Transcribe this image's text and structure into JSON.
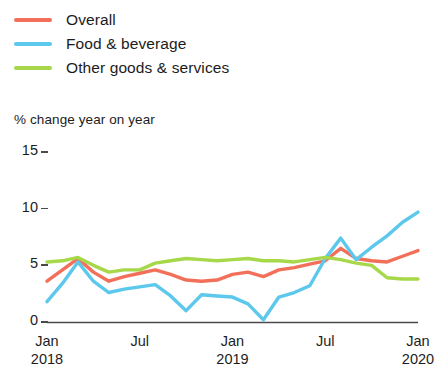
{
  "chart_data": {
    "type": "line",
    "title": "",
    "subtitle": "",
    "xlabel": "",
    "ylabel": "% change year on year",
    "ylim": [
      0,
      15
    ],
    "yticks": [
      0,
      5,
      10,
      15
    ],
    "ytick_labels": [
      "0",
      "5",
      "10",
      "15"
    ],
    "grid": false,
    "legend_position": "top-left",
    "x": [
      "Jan 2018",
      "Feb 2018",
      "Mar 2018",
      "Apr 2018",
      "May 2018",
      "Jun 2018",
      "Jul 2018",
      "Aug 2018",
      "Sep 2018",
      "Oct 2018",
      "Nov 2018",
      "Dec 2018",
      "Jan 2019",
      "Feb 2019",
      "Mar 2019",
      "Apr 2019",
      "May 2019",
      "Jun 2019",
      "Jul 2019",
      "Aug 2019",
      "Sep 2019",
      "Oct 2019",
      "Nov 2019",
      "Dec 2019",
      "Jan 2020"
    ],
    "xtick_positions": [
      "Jan 2018",
      "Jul 2018",
      "Jan 2019",
      "Jul 2019",
      "Jan 2020"
    ],
    "xtick_labels": [
      {
        "month": "Jan",
        "year": "2018"
      },
      {
        "month": "Jul",
        "year": ""
      },
      {
        "month": "Jan",
        "year": "2019"
      },
      {
        "month": "Jul",
        "year": ""
      },
      {
        "month": "Jan",
        "year": "2020"
      }
    ],
    "series": [
      {
        "name": "Overall",
        "color": "#F2705A",
        "values": [
          3.6,
          4.6,
          5.6,
          4.4,
          3.6,
          4.0,
          4.3,
          4.6,
          4.2,
          3.7,
          3.6,
          3.7,
          4.2,
          4.4,
          4.0,
          4.6,
          4.8,
          5.1,
          5.4,
          6.5,
          5.6,
          5.4,
          5.3,
          5.8,
          6.3
        ]
      },
      {
        "name": "Food & beverage",
        "color": "#5BC8EC",
        "values": [
          1.8,
          3.4,
          5.3,
          3.6,
          2.6,
          2.9,
          3.1,
          3.3,
          2.3,
          1.0,
          2.4,
          2.3,
          2.2,
          1.6,
          0.2,
          2.2,
          2.6,
          3.2,
          5.6,
          7.4,
          5.5,
          6.6,
          7.6,
          8.8,
          9.7
        ]
      },
      {
        "name": "Other goods & services",
        "color": "#A6D84A",
        "values": [
          5.3,
          5.4,
          5.7,
          5.0,
          4.4,
          4.6,
          4.6,
          5.2,
          5.4,
          5.6,
          5.5,
          5.4,
          5.5,
          5.6,
          5.4,
          5.4,
          5.3,
          5.5,
          5.7,
          5.5,
          5.2,
          5.0,
          3.9,
          3.8,
          3.8
        ]
      }
    ]
  },
  "legend": {
    "items": [
      {
        "label": "Overall",
        "color": "#F2705A"
      },
      {
        "label": "Food & beverage",
        "color": "#5BC8EC"
      },
      {
        "label": "Other goods & services",
        "color": "#A6D84A"
      }
    ]
  },
  "axes": {
    "y_caption": "% change year on year",
    "axis_color": "#4a4a4a"
  }
}
